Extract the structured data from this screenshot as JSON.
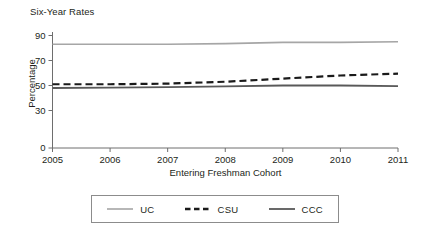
{
  "chart_data": {
    "type": "line",
    "title": "Six-Year Rates",
    "xlabel": "Entering Freshman Cohort",
    "ylabel": "Percentage",
    "x": [
      2005,
      2006,
      2007,
      2008,
      2009,
      2010,
      2011
    ],
    "xticklabels": [
      "2005",
      "2006",
      "2007",
      "2008",
      "2009",
      "2010",
      "2011"
    ],
    "xlim": [
      2005,
      2011
    ],
    "ylim": [
      0,
      92
    ],
    "yticks": [
      0,
      30,
      50,
      70,
      90
    ],
    "yticklabels": [
      "0",
      "30",
      "50",
      "70",
      "90"
    ],
    "grid": false,
    "legend_position": "below",
    "series": [
      {
        "name": "UC",
        "color": "#a6a6a6",
        "style": "solid",
        "width": 1.6,
        "values": [
          83,
          83,
          83,
          83.5,
          84.5,
          84.5,
          85
        ]
      },
      {
        "name": "CSU",
        "color": "#1a1a1a",
        "style": "dashed",
        "width": 2.2,
        "values": [
          51,
          51,
          51.5,
          53,
          55.5,
          58,
          59.5
        ]
      },
      {
        "name": "CCC",
        "color": "#595959",
        "style": "solid",
        "width": 1.8,
        "values": [
          48,
          48.3,
          48.7,
          49.3,
          50,
          50,
          49.5
        ]
      }
    ]
  },
  "legend": {
    "items": [
      {
        "label": "UC",
        "color": "#a6a6a6",
        "style": "solid"
      },
      {
        "label": "CSU",
        "color": "#1a1a1a",
        "style": "dashed"
      },
      {
        "label": "CCC",
        "color": "#595959",
        "style": "solid"
      }
    ]
  },
  "axes": {
    "color": "#6e6e6e"
  }
}
